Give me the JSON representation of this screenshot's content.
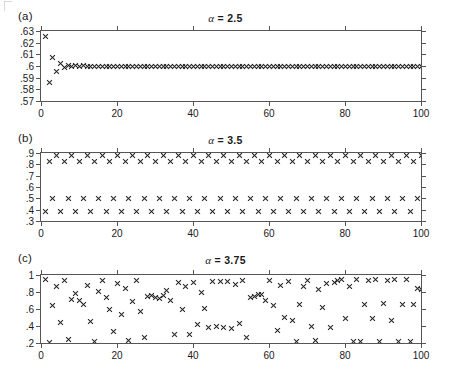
{
  "figure": {
    "caption": "",
    "corner_mark": "crop-corner-mark"
  },
  "panels": [
    {
      "label": "(a)",
      "title_alpha": "α",
      "title_rest": " = 2.5",
      "title_text": "α = 2.5"
    },
    {
      "label": "(b)",
      "title_alpha": "α",
      "title_rest": " = 3.5",
      "title_text": "α = 3.5"
    },
    {
      "label": "(c)",
      "title_alpha": "α",
      "title_rest": " = 3.75",
      "title_text": "α = 3.75"
    }
  ],
  "chart_data": [
    {
      "type": "scatter",
      "panel": "(a)",
      "title": "α = 2.5",
      "xlabel": "",
      "ylabel": "",
      "marker": "x",
      "grid": false,
      "legend": null,
      "xlim": [
        0,
        100
      ],
      "ylim": [
        0.57,
        0.63
      ],
      "xticks": [
        0,
        20,
        40,
        60,
        80,
        100
      ],
      "xticklabels": [
        "0",
        "20",
        "40",
        "60",
        "80",
        "100"
      ],
      "yticks": [
        0.57,
        0.58,
        0.59,
        0.6,
        0.61,
        0.62,
        0.63
      ],
      "yticklabels": [
        ".57",
        ".58",
        ".59",
        ".6",
        ".61",
        ".62",
        ".63"
      ],
      "x": [
        1,
        2,
        3,
        4,
        5,
        6,
        7,
        8,
        9,
        10,
        11,
        12,
        13,
        14,
        15,
        16,
        17,
        18,
        19,
        20,
        21,
        22,
        23,
        24,
        25,
        26,
        27,
        28,
        29,
        30,
        31,
        32,
        33,
        34,
        35,
        36,
        37,
        38,
        39,
        40,
        41,
        42,
        43,
        44,
        45,
        46,
        47,
        48,
        49,
        50,
        51,
        52,
        53,
        54,
        55,
        56,
        57,
        58,
        59,
        60,
        61,
        62,
        63,
        64,
        65,
        66,
        67,
        68,
        69,
        70,
        71,
        72,
        73,
        74,
        75,
        76,
        77,
        78,
        79,
        80,
        81,
        82,
        83,
        84,
        85,
        86,
        87,
        88,
        89,
        90,
        91,
        92,
        93,
        94,
        95,
        96,
        97,
        98,
        99,
        100
      ],
      "y": [
        0.6249,
        0.586,
        0.607,
        0.5957,
        0.6021,
        0.5989,
        0.6006,
        0.5997,
        0.6002,
        0.5999,
        0.6001,
        0.6,
        0.6,
        0.6,
        0.6,
        0.6,
        0.6,
        0.6,
        0.6,
        0.6,
        0.6,
        0.6,
        0.6,
        0.6,
        0.6,
        0.6,
        0.6,
        0.6,
        0.6,
        0.6,
        0.6,
        0.6,
        0.6,
        0.6,
        0.6,
        0.6,
        0.6,
        0.6,
        0.6,
        0.6,
        0.6,
        0.6,
        0.6,
        0.6,
        0.6,
        0.6,
        0.6,
        0.6,
        0.6,
        0.6,
        0.6,
        0.6,
        0.6,
        0.6,
        0.6,
        0.6,
        0.6,
        0.6,
        0.6,
        0.6,
        0.6,
        0.6,
        0.6,
        0.6,
        0.6,
        0.6,
        0.6,
        0.6,
        0.6,
        0.6,
        0.6,
        0.6,
        0.6,
        0.6,
        0.6,
        0.6,
        0.6,
        0.6,
        0.6,
        0.6,
        0.6,
        0.6,
        0.6,
        0.6,
        0.6,
        0.6,
        0.6,
        0.6,
        0.6,
        0.6,
        0.6,
        0.6,
        0.6,
        0.6,
        0.6,
        0.6,
        0.6,
        0.6,
        0.6,
        0.6
      ]
    },
    {
      "type": "scatter",
      "panel": "(b)",
      "title": "α = 3.5",
      "xlabel": "",
      "ylabel": "",
      "marker": "x",
      "grid": false,
      "legend": null,
      "xlim": [
        0,
        100
      ],
      "ylim": [
        0.3,
        0.9
      ],
      "xticks": [
        0,
        20,
        40,
        60,
        80,
        100
      ],
      "xticklabels": [
        "0",
        "20",
        "40",
        "60",
        "80",
        "100"
      ],
      "yticks": [
        0.3,
        0.4,
        0.5,
        0.6,
        0.7,
        0.8,
        0.9
      ],
      "yticklabels": [
        ".3",
        ".4",
        ".5",
        ".6",
        ".7",
        ".8",
        ".9"
      ],
      "x": [
        1,
        2,
        3,
        4,
        5,
        6,
        7,
        8,
        9,
        10,
        11,
        12,
        13,
        14,
        15,
        16,
        17,
        18,
        19,
        20,
        21,
        22,
        23,
        24,
        25,
        26,
        27,
        28,
        29,
        30,
        31,
        32,
        33,
        34,
        35,
        36,
        37,
        38,
        39,
        40,
        41,
        42,
        43,
        44,
        45,
        46,
        47,
        48,
        49,
        50,
        51,
        52,
        53,
        54,
        55,
        56,
        57,
        58,
        59,
        60,
        61,
        62,
        63,
        64,
        65,
        66,
        67,
        68,
        69,
        70,
        71,
        72,
        73,
        74,
        75,
        76,
        77,
        78,
        79,
        80,
        81,
        82,
        83,
        84,
        85,
        86,
        87,
        88,
        89,
        90,
        91,
        92,
        93,
        94,
        95,
        96,
        97,
        98,
        99,
        100
      ],
      "y": [
        0.3828,
        0.8269,
        0.5009,
        0.875,
        0.3828,
        0.8269,
        0.5009,
        0.875,
        0.3828,
        0.8269,
        0.5009,
        0.875,
        0.3828,
        0.8269,
        0.5009,
        0.875,
        0.3828,
        0.8269,
        0.5009,
        0.875,
        0.3828,
        0.8269,
        0.5009,
        0.875,
        0.3828,
        0.8269,
        0.5009,
        0.875,
        0.3828,
        0.8269,
        0.5009,
        0.875,
        0.3828,
        0.8269,
        0.5009,
        0.875,
        0.3828,
        0.8269,
        0.5009,
        0.875,
        0.3828,
        0.8269,
        0.5009,
        0.875,
        0.3828,
        0.8269,
        0.5009,
        0.875,
        0.3828,
        0.8269,
        0.5009,
        0.875,
        0.3828,
        0.8269,
        0.5009,
        0.875,
        0.3828,
        0.8269,
        0.5009,
        0.875,
        0.3828,
        0.8269,
        0.5009,
        0.875,
        0.3828,
        0.8269,
        0.5009,
        0.875,
        0.3828,
        0.8269,
        0.5009,
        0.875,
        0.3828,
        0.8269,
        0.5009,
        0.875,
        0.3828,
        0.8269,
        0.5009,
        0.875,
        0.3828,
        0.8269,
        0.5009,
        0.875,
        0.3828,
        0.8269,
        0.5009,
        0.875,
        0.3828,
        0.8269,
        0.5009,
        0.875,
        0.3828,
        0.8269,
        0.5009,
        0.875,
        0.3828,
        0.8269,
        0.5009,
        0.875
      ]
    },
    {
      "type": "scatter",
      "panel": "(c)",
      "title": "α = 3.75",
      "xlabel": "",
      "ylabel": "",
      "marker": "x",
      "grid": false,
      "legend": null,
      "xlim": [
        0,
        100
      ],
      "ylim": [
        0.2,
        1.0
      ],
      "xticks": [
        0,
        20,
        40,
        60,
        80,
        100
      ],
      "xticklabels": [
        "0",
        "20",
        "40",
        "60",
        "80",
        "100"
      ],
      "yticks": [
        0.2,
        0.4,
        0.6,
        0.8,
        1.0
      ],
      "yticklabels": [
        ".2",
        ".4",
        ".6",
        ".8",
        "1"
      ],
      "x": [
        1,
        2,
        3,
        4,
        5,
        6,
        7,
        8,
        9,
        10,
        11,
        12,
        13,
        14,
        15,
        16,
        17,
        18,
        19,
        20,
        21,
        22,
        23,
        24,
        25,
        26,
        27,
        28,
        29,
        30,
        31,
        32,
        33,
        34,
        35,
        36,
        37,
        38,
        39,
        40,
        41,
        42,
        43,
        44,
        45,
        46,
        47,
        48,
        49,
        50,
        51,
        52,
        53,
        54,
        55,
        56,
        57,
        58,
        59,
        60,
        61,
        62,
        63,
        64,
        65,
        66,
        67,
        68,
        69,
        70,
        71,
        72,
        73,
        74,
        75,
        76,
        77,
        78,
        79,
        80,
        81,
        82,
        83,
        84,
        85,
        86,
        87,
        88,
        89,
        90,
        91,
        92,
        93,
        94,
        95,
        96,
        97,
        98,
        99,
        100
      ],
      "y": [
        0.945,
        0.21,
        0.645,
        0.87,
        0.445,
        0.94,
        0.245,
        0.715,
        0.78,
        0.695,
        0.65,
        0.875,
        0.455,
        0.22,
        0.81,
        0.935,
        0.735,
        0.6,
        0.33,
        0.905,
        0.54,
        0.84,
        0.23,
        0.69,
        0.935,
        0.57,
        0.27,
        0.745,
        0.76,
        0.74,
        0.725,
        0.755,
        0.815,
        0.695,
        0.295,
        0.915,
        0.595,
        0.87,
        0.3,
        0.915,
        0.42,
        0.8,
        0.605,
        0.385,
        0.925,
        0.39,
        0.925,
        0.38,
        0.92,
        0.365,
        0.885,
        0.435,
        0.935,
        0.26,
        0.73,
        0.745,
        0.77,
        0.765,
        0.7,
        0.94,
        0.645,
        0.345,
        0.88,
        0.5,
        0.925,
        0.46,
        0.22,
        0.655,
        0.86,
        0.935,
        0.4,
        0.225,
        0.835,
        0.62,
        0.9,
        0.38,
        0.91,
        0.93,
        0.945,
        0.485,
        0.86,
        0.215,
        0.945,
        0.215,
        0.65,
        0.94,
        0.485,
        0.945,
        0.22,
        0.66,
        0.935,
        0.47,
        0.945,
        0.215,
        0.655,
        0.945,
        0.215,
        0.65,
        0.84,
        0.835
      ]
    }
  ]
}
